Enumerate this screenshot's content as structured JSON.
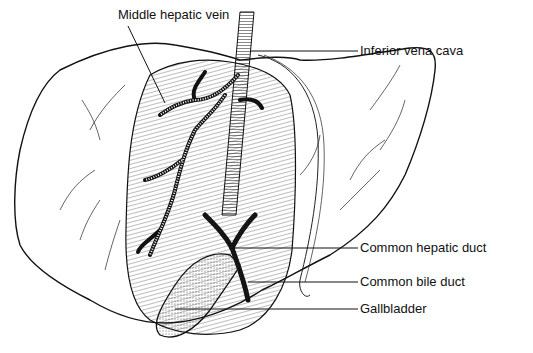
{
  "diagram": {
    "labels": [
      {
        "id": "middle-hepatic-vein",
        "text": "Middle hepatic vein",
        "x": 118,
        "y": 7
      },
      {
        "id": "inferior-vena-cava",
        "text": "Inferior vena cava",
        "x": 360,
        "y": 43
      },
      {
        "id": "common-hepatic-duct",
        "text": "Common hepatic duct",
        "x": 360,
        "y": 240
      },
      {
        "id": "common-bile-duct",
        "text": "Common bile duct",
        "x": 360,
        "y": 274
      },
      {
        "id": "gallbladder",
        "text": "Gallbladder",
        "x": 360,
        "y": 301
      }
    ],
    "colors": {
      "ink": "#111111",
      "background": "#ffffff"
    }
  }
}
